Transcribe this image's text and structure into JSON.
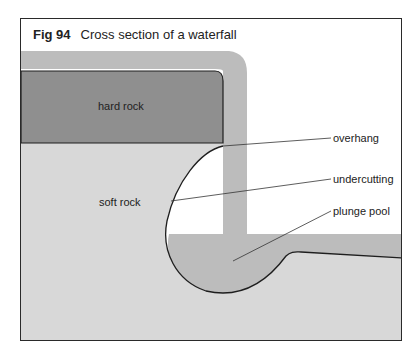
{
  "figure": {
    "number": "Fig 94",
    "title": "Cross section of a waterfall"
  },
  "labels": {
    "hard_rock": "hard rock",
    "soft_rock": "soft rock",
    "overhang": "overhang",
    "undercutting": "undercutting",
    "plunge_pool": "plunge pool"
  },
  "colors": {
    "hard_rock": "#8f8f8f",
    "soft_rock": "#d8d8d8",
    "water": "#bcbcbc",
    "outline": "#1e1e1e",
    "frame": "#2a2a2a"
  }
}
